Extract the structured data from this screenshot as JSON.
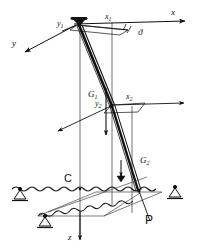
{
  "figure": {
    "kind": "engineering-mechanics-diagram",
    "background_color": "#ffffff",
    "ink_color": "#111111",
    "axes": {
      "x_global": {
        "label": "x",
        "sub": ""
      },
      "y_global": {
        "label": "y",
        "sub": ""
      },
      "z_global": {
        "label": "z",
        "sub": ""
      },
      "x1_local": {
        "label": "x",
        "sub": "1"
      },
      "y1_local": {
        "label": "y",
        "sub": "1"
      },
      "x2_local": {
        "label": "x",
        "sub": "2"
      },
      "y2_local": {
        "label": "y",
        "sub": "2"
      }
    },
    "angle": {
      "label": "ϑ",
      "name": "theta-angle"
    },
    "forces": [
      {
        "label": "G",
        "sub": "1",
        "direction": "down",
        "name": "weight-force-g1"
      },
      {
        "label": "G",
        "sub": "2",
        "direction": "down",
        "name": "weight-force-g2"
      }
    ],
    "points": [
      {
        "label": "C",
        "name": "point-c"
      },
      {
        "label": "P",
        "name": "point-p"
      }
    ],
    "supports": [
      {
        "name": "pin-support-left",
        "type": "pin"
      },
      {
        "name": "pin-support-right",
        "type": "pin"
      },
      {
        "name": "pin-support-front",
        "type": "pin"
      }
    ],
    "members": [
      {
        "name": "upper-boom-segment"
      },
      {
        "name": "lower-boom-segment"
      },
      {
        "name": "top-pivot-joint"
      }
    ]
  }
}
